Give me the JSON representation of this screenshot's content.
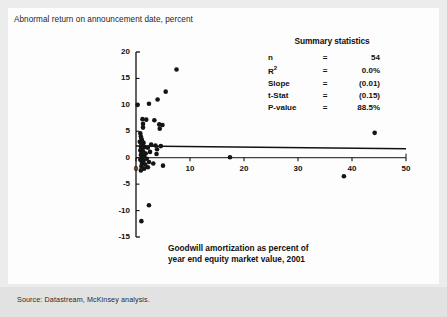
{
  "header": {
    "title": "Abnormal return on announcement date, percent"
  },
  "footer": {
    "source": "Source: Datastream, McKinsey analysis."
  },
  "summary": {
    "title": "Summary statistics",
    "rows": [
      {
        "key": "n",
        "eq": "=",
        "value": "54"
      },
      {
        "key": "R2",
        "eq": "=",
        "value": "0.0%"
      },
      {
        "key": "Slope",
        "eq": "=",
        "value": "(0.01)"
      },
      {
        "key": "t-Stat",
        "eq": "=",
        "value": "(0.15)"
      },
      {
        "key": "P-value",
        "eq": "=",
        "value": "88.5%"
      }
    ]
  },
  "xaxis_caption": {
    "line1": "Goodwill amortization as percent of",
    "line2": "year end equity market value, 2001"
  },
  "chart_data": {
    "type": "scatter",
    "title": "Abnormal return on announcement date, percent",
    "xlabel": "Goodwill amortization as percent of year end equity market value, 2001",
    "ylabel": "Abnormal return on announcement date, percent",
    "xlim": [
      0,
      50
    ],
    "ylim": [
      -15,
      20
    ],
    "xticks": [
      0,
      10,
      20,
      30,
      40,
      50
    ],
    "yticks": [
      -15,
      -10,
      -5,
      0,
      5,
      10,
      15,
      20
    ],
    "grid": false,
    "legend": null,
    "n": 54,
    "r_squared": 0.0,
    "slope": -0.01,
    "t_stat": -0.15,
    "p_value": 0.885,
    "trendline": {
      "type": "line",
      "x": [
        0,
        50
      ],
      "y": [
        2.2,
        1.7
      ]
    },
    "points": [
      {
        "x": 7.5,
        "y": 16.7
      },
      {
        "x": 5.5,
        "y": 12.5
      },
      {
        "x": 4.0,
        "y": 11.0
      },
      {
        "x": 2.4,
        "y": 10.2
      },
      {
        "x": 0.3,
        "y": 10.0
      },
      {
        "x": 1.2,
        "y": 7.3
      },
      {
        "x": 1.9,
        "y": 7.2
      },
      {
        "x": 3.4,
        "y": 7.1
      },
      {
        "x": 1.3,
        "y": 6.4
      },
      {
        "x": 4.3,
        "y": 6.3
      },
      {
        "x": 4.9,
        "y": 6.2
      },
      {
        "x": 1.3,
        "y": 5.7
      },
      {
        "x": 4.4,
        "y": 5.5
      },
      {
        "x": 44.2,
        "y": 4.7
      },
      {
        "x": 0.8,
        "y": 4.6
      },
      {
        "x": 0.9,
        "y": 4.0
      },
      {
        "x": 1.0,
        "y": 3.6
      },
      {
        "x": 1.1,
        "y": 3.3
      },
      {
        "x": 0.7,
        "y": 3.0
      },
      {
        "x": 1.4,
        "y": 2.8
      },
      {
        "x": 2.8,
        "y": 2.5
      },
      {
        "x": 1.0,
        "y": 2.4
      },
      {
        "x": 3.6,
        "y": 2.3
      },
      {
        "x": 4.6,
        "y": 2.2
      },
      {
        "x": 0.9,
        "y": 2.1
      },
      {
        "x": 1.6,
        "y": 2.0
      },
      {
        "x": 2.2,
        "y": 1.9
      },
      {
        "x": 1.1,
        "y": 1.7
      },
      {
        "x": 3.9,
        "y": 1.6
      },
      {
        "x": 0.8,
        "y": 1.4
      },
      {
        "x": 1.3,
        "y": 1.2
      },
      {
        "x": 2.6,
        "y": 1.1
      },
      {
        "x": 1.0,
        "y": 0.9
      },
      {
        "x": 1.8,
        "y": 0.8
      },
      {
        "x": 3.8,
        "y": 0.7
      },
      {
        "x": 0.9,
        "y": 0.5
      },
      {
        "x": 1.5,
        "y": 0.3
      },
      {
        "x": 17.4,
        "y": 0.1
      },
      {
        "x": 1.2,
        "y": 0.0
      },
      {
        "x": 2.0,
        "y": -0.2
      },
      {
        "x": 0.8,
        "y": -0.4
      },
      {
        "x": 1.4,
        "y": -0.6
      },
      {
        "x": 2.4,
        "y": -0.8
      },
      {
        "x": 1.1,
        "y": -1.0
      },
      {
        "x": 3.2,
        "y": -1.1
      },
      {
        "x": 1.7,
        "y": -1.3
      },
      {
        "x": 5.0,
        "y": -1.5
      },
      {
        "x": 1.0,
        "y": -1.6
      },
      {
        "x": 2.2,
        "y": -1.8
      },
      {
        "x": 1.5,
        "y": -2.1
      },
      {
        "x": 0.9,
        "y": -2.4
      },
      {
        "x": 38.5,
        "y": -3.5
      },
      {
        "x": 2.4,
        "y": -9.0
      },
      {
        "x": 1.0,
        "y": -12.0
      }
    ]
  },
  "axis_geometry": {
    "x0_px": 136,
    "x50_px": 406,
    "y20_px": 52,
    "ym15_px": 237
  }
}
